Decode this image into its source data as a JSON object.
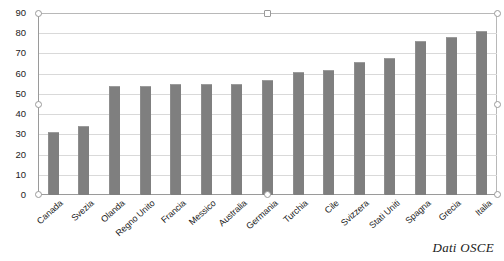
{
  "chart_data": {
    "type": "bar",
    "title": "",
    "xlabel": "",
    "ylabel": "",
    "ylim": [
      0,
      90
    ],
    "ytick_step": 10,
    "yticks": [
      0,
      10,
      20,
      30,
      40,
      50,
      60,
      70,
      80,
      90
    ],
    "grid": true,
    "legend": "none",
    "bar_color": "#7f7f7f",
    "gridline_color": "#d9d9d9",
    "axis_color": "#9a9a9a",
    "categories": [
      "Canada",
      "Svezia",
      "Olanda",
      "Regno Unito",
      "Francia",
      "Messico",
      "Australia",
      "Germania",
      "Turchia",
      "Cile",
      "Svizzera",
      "Stati Uniti",
      "Spagna",
      "Grecia",
      "Italia"
    ],
    "values": [
      31,
      34,
      54,
      54,
      55,
      55,
      55,
      57,
      61,
      62,
      66,
      68,
      76,
      78,
      81
    ],
    "series": [
      {
        "name": "",
        "values": [
          31,
          34,
          54,
          54,
          55,
          55,
          55,
          57,
          61,
          62,
          66,
          68,
          76,
          78,
          81
        ]
      }
    ],
    "annotations": [
      "Dati OSCE"
    ]
  },
  "caption": {
    "source": "Dati OSCE"
  },
  "selection": {
    "handles": [
      "handle-top-left",
      "handle-top-center",
      "handle-top-right",
      "handle-middle-left",
      "handle-middle-right",
      "handle-bottom-left",
      "handle-bottom-center",
      "handle-bottom-right"
    ]
  }
}
